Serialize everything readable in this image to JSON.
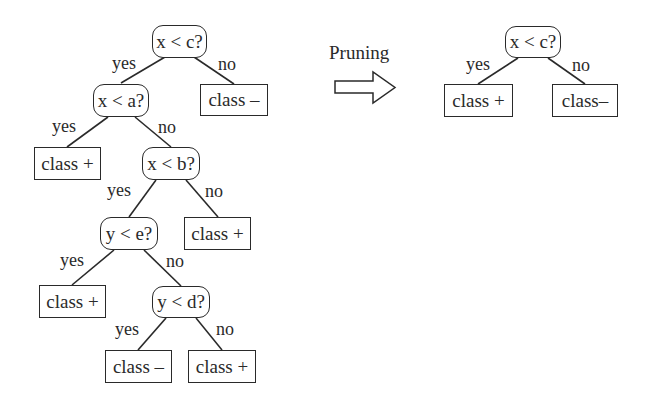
{
  "diagram": {
    "type": "decision-tree-pruning",
    "caption": "Pruning",
    "colors": {
      "stroke": "#2a2a2a",
      "background": "#ffffff"
    },
    "original_tree": {
      "nodes": {
        "n1": {
          "label": "x < c?",
          "kind": "decision"
        },
        "n2": {
          "label": "x < a?",
          "kind": "decision"
        },
        "n3": {
          "label": "class –",
          "kind": "leaf"
        },
        "n4": {
          "label": "class +",
          "kind": "leaf"
        },
        "n5": {
          "label": "x < b?",
          "kind": "decision"
        },
        "n6": {
          "label": "y < e?",
          "kind": "decision"
        },
        "n7": {
          "label": "class +",
          "kind": "leaf"
        },
        "n8": {
          "label": "class +",
          "kind": "leaf"
        },
        "n9": {
          "label": "y < d?",
          "kind": "decision"
        },
        "n10": {
          "label": "class –",
          "kind": "leaf"
        },
        "n11": {
          "label": "class +",
          "kind": "leaf"
        }
      },
      "edges": {
        "e1": {
          "from": "n1",
          "to": "n2",
          "label": "yes"
        },
        "e2": {
          "from": "n1",
          "to": "n3",
          "label": "no"
        },
        "e3": {
          "from": "n2",
          "to": "n4",
          "label": "yes"
        },
        "e4": {
          "from": "n2",
          "to": "n5",
          "label": "no"
        },
        "e5": {
          "from": "n5",
          "to": "n6",
          "label": "yes"
        },
        "e6": {
          "from": "n5",
          "to": "n7",
          "label": "no"
        },
        "e7": {
          "from": "n6",
          "to": "n8",
          "label": "yes"
        },
        "e8": {
          "from": "n6",
          "to": "n9",
          "label": "no"
        },
        "e9": {
          "from": "n9",
          "to": "n10",
          "label": "yes"
        },
        "e10": {
          "from": "n9",
          "to": "n11",
          "label": "no"
        }
      }
    },
    "pruned_tree": {
      "nodes": {
        "p1": {
          "label": "x < c?",
          "kind": "decision"
        },
        "p2": {
          "label": "class +",
          "kind": "leaf"
        },
        "p3": {
          "label": "class–",
          "kind": "leaf"
        }
      },
      "edges": {
        "pe1": {
          "from": "p1",
          "to": "p2",
          "label": "yes"
        },
        "pe2": {
          "from": "p1",
          "to": "p3",
          "label": "no"
        }
      }
    }
  }
}
